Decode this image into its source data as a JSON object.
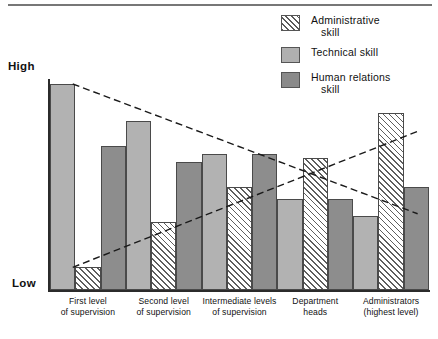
{
  "figure": {
    "top_rule": true,
    "axis": {
      "y_top_label": "High",
      "y_bottom_label": "Low"
    }
  },
  "legend": {
    "position": "top-right",
    "items": [
      {
        "key": "administrative",
        "line1": "Administrative",
        "line2": "skill",
        "swatch": "hatched-diagonal",
        "color": "#ffffff"
      },
      {
        "key": "technical",
        "line1": "Technical skill",
        "line2": "",
        "swatch": "solid-light-gray",
        "color": "#b2b2b2"
      },
      {
        "key": "human",
        "line1": "Human relations",
        "line2": "skill",
        "swatch": "solid-dark-gray",
        "color": "#8d8d8d"
      }
    ]
  },
  "chart_data": {
    "type": "bar",
    "title": "",
    "xlabel": "",
    "ylabel": "",
    "ylim": [
      0,
      100
    ],
    "y_tick_labels": [
      "Low",
      "High"
    ],
    "grid": false,
    "legend_position": "top-right",
    "categories": [
      "First level of supervision",
      "Second level of supervision",
      "Intermediate levels of supervision",
      "Department heads",
      "Administrators (highest level)"
    ],
    "category_lines": [
      [
        "First level",
        "of supervision"
      ],
      [
        "Second level",
        "of supervision"
      ],
      [
        "Intermediate levels",
        "of supervision"
      ],
      [
        "Department",
        "heads"
      ],
      [
        "Administrators",
        "(highest level)"
      ]
    ],
    "bar_order": [
      "technical",
      "administrative",
      "human"
    ],
    "series": [
      {
        "name": "Technical skill",
        "key": "technical",
        "color": "#b2b2b2",
        "values": [
          100,
          82,
          66,
          44,
          36
        ]
      },
      {
        "name": "Administrative skill",
        "key": "administrative",
        "color": "#ffffff",
        "pattern": "diagonal-hatch",
        "values": [
          11,
          33,
          50,
          64,
          86
        ]
      },
      {
        "name": "Human relations skill",
        "key": "human",
        "color": "#8d8d8d",
        "values": [
          70,
          62,
          66,
          44,
          50
        ]
      }
    ],
    "annotations": [
      {
        "type": "dashed-line",
        "name": "technical-skill-trend",
        "from": [
          0.06,
          100
        ],
        "to": [
          0.97,
          37
        ],
        "direction": "descending"
      },
      {
        "type": "dashed-line",
        "name": "administrative-skill-trend",
        "from": [
          0.06,
          11
        ],
        "to": [
          0.97,
          77
        ],
        "direction": "ascending"
      }
    ]
  }
}
